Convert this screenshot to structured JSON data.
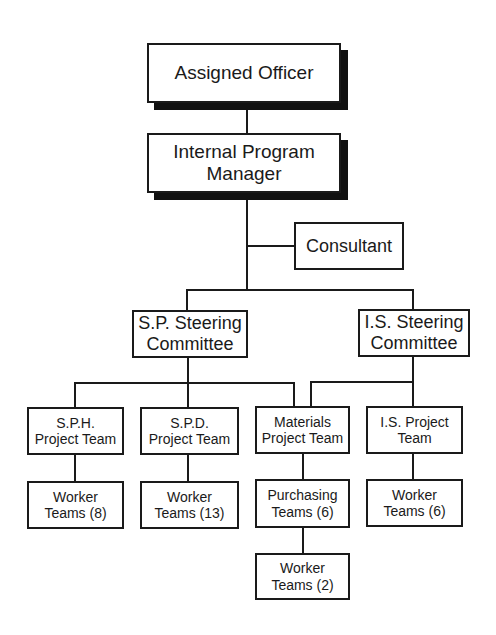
{
  "diagram": {
    "type": "org-chart",
    "nodes": {
      "assigned_officer": {
        "line1": "Assigned Officer",
        "line2": ""
      },
      "internal_program_manager": {
        "line1": "Internal Program",
        "line2": "Manager"
      },
      "consultant": {
        "line1": "Consultant",
        "line2": ""
      },
      "sp_steering": {
        "line1": "S.P. Steering",
        "line2": "Committee"
      },
      "is_steering": {
        "line1": "I.S. Steering",
        "line2": "Committee"
      },
      "sph_project": {
        "line1": "S.P.H.",
        "line2": "Project Team"
      },
      "spd_project": {
        "line1": "S.P.D.",
        "line2": "Project Team"
      },
      "materials_project": {
        "line1": "Materials",
        "line2": "Project Team"
      },
      "is_project": {
        "line1": "I.S. Project",
        "line2": "Team"
      },
      "sph_workers": {
        "line1": "Worker",
        "line2": "Teams (8)"
      },
      "spd_workers": {
        "line1": "Worker",
        "line2": "Teams (13)"
      },
      "purchasing": {
        "line1": "Purchasing",
        "line2": "Teams (6)"
      },
      "is_workers": {
        "line1": "Worker",
        "line2": "Teams (6)"
      },
      "purchasing_workers": {
        "line1": "Worker",
        "line2": "Teams (2)"
      }
    },
    "edges": [
      [
        "assigned_officer",
        "internal_program_manager"
      ],
      [
        "internal_program_manager",
        "consultant"
      ],
      [
        "internal_program_manager",
        "sp_steering"
      ],
      [
        "internal_program_manager",
        "is_steering"
      ],
      [
        "sp_steering",
        "sph_project"
      ],
      [
        "sp_steering",
        "spd_project"
      ],
      [
        "sp_steering",
        "materials_project"
      ],
      [
        "is_steering",
        "materials_project"
      ],
      [
        "is_steering",
        "is_project"
      ],
      [
        "sph_project",
        "sph_workers"
      ],
      [
        "spd_project",
        "spd_workers"
      ],
      [
        "materials_project",
        "purchasing"
      ],
      [
        "purchasing",
        "purchasing_workers"
      ],
      [
        "is_project",
        "is_workers"
      ]
    ],
    "colors": {
      "line": "#1a1a1a",
      "box_fill": "#ffffff",
      "shadow": "#111111"
    }
  }
}
